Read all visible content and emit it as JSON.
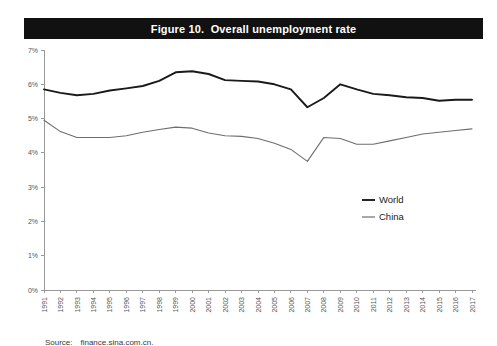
{
  "figure": {
    "title": "Figure 10.  Overall unemployment rate",
    "source_label": "Source:",
    "source_value": "finance.sina.com.cn."
  },
  "legend": {
    "position": "center-right",
    "entries": [
      {
        "label": "World",
        "color": "#1a1a1a"
      },
      {
        "label": "China",
        "color": "#6e6e6e"
      }
    ]
  },
  "colors": {
    "title_bar_bg": "#111111",
    "title_text": "#ffffff",
    "axis": "#999999",
    "world_line": "#1a1a1a",
    "china_line": "#6e6e6e",
    "tick_label": "#555555",
    "page_bg": "#ffffff"
  },
  "chart_data": {
    "type": "line",
    "title": "Figure 10.  Overall unemployment rate",
    "subtitle": "",
    "xlabel": "",
    "ylabel": "",
    "grid": false,
    "legend_position": "center-right",
    "ylim": [
      0,
      7
    ],
    "ytick_labels": [
      "0%",
      "1%",
      "2%",
      "3%",
      "4%",
      "5%",
      "6%",
      "7%"
    ],
    "ytick_values": [
      0,
      1,
      2,
      3,
      4,
      5,
      6,
      7
    ],
    "x": [
      1991,
      1992,
      1993,
      1994,
      1995,
      1996,
      1997,
      1998,
      1999,
      2000,
      2001,
      2002,
      2003,
      2004,
      2005,
      2006,
      2007,
      2008,
      2009,
      2010,
      2011,
      2012,
      2013,
      2014,
      2015,
      2016,
      2017
    ],
    "xtick_labels": [
      "1991",
      "1992",
      "1993",
      "1994",
      "1995",
      "1996",
      "1997",
      "1998",
      "1999",
      "2000",
      "2001",
      "2002",
      "2003",
      "2004",
      "2005",
      "2006",
      "2007",
      "2008",
      "2009",
      "2010",
      "2011",
      "2012",
      "2013",
      "2014",
      "2015",
      "2016",
      "2017"
    ],
    "series": [
      {
        "name": "World",
        "color": "#1a1a1a",
        "values": [
          5.85,
          5.75,
          5.68,
          5.72,
          5.82,
          5.88,
          5.95,
          6.1,
          6.35,
          6.38,
          6.3,
          6.12,
          6.1,
          6.08,
          6.0,
          5.85,
          5.33,
          5.6,
          6.0,
          5.85,
          5.72,
          5.68,
          5.62,
          5.6,
          5.52,
          5.55,
          5.55
        ]
      },
      {
        "name": "China",
        "color": "#6e6e6e",
        "values": [
          4.95,
          4.62,
          4.45,
          4.45,
          4.45,
          4.5,
          4.6,
          4.68,
          4.75,
          4.72,
          4.58,
          4.5,
          4.48,
          4.42,
          4.28,
          4.1,
          3.75,
          4.45,
          4.42,
          4.25,
          4.25,
          4.35,
          4.45,
          4.55,
          4.6,
          4.65,
          4.7
        ]
      }
    ]
  }
}
